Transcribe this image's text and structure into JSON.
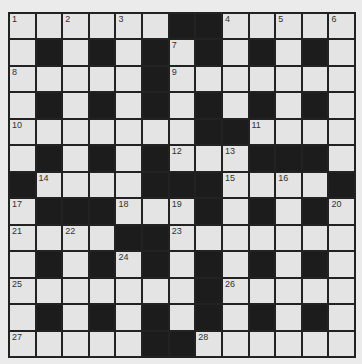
{
  "puzzle": {
    "rows": 13,
    "cols": 13,
    "colors": {
      "background": "#ebebeb",
      "cell": "#e4e4e4",
      "block": "#1c1c1c",
      "line": "#222222",
      "number": "#333333"
    },
    "layout": [
      "......##.....",
      ".#.#.#.#.#.#.",
      ".....#.......",
      ".#.#.#.#.#.#.",
      ".......##....",
      ".#.#.#...###.",
      "#....###....#",
      ".###...#.#.#.",
      "....##.......",
      ".#.#.#.#.#.#.",
      ".......#.....",
      ".#.#.#.#.#.#.",
      ".....##......"
    ],
    "numbers": [
      {
        "r": 0,
        "c": 0,
        "n": "1"
      },
      {
        "r": 0,
        "c": 2,
        "n": "2"
      },
      {
        "r": 0,
        "c": 4,
        "n": "3"
      },
      {
        "r": 0,
        "c": 8,
        "n": "4"
      },
      {
        "r": 0,
        "c": 10,
        "n": "5"
      },
      {
        "r": 0,
        "c": 12,
        "n": "6"
      },
      {
        "r": 1,
        "c": 6,
        "n": "7"
      },
      {
        "r": 2,
        "c": 0,
        "n": "8"
      },
      {
        "r": 2,
        "c": 6,
        "n": "9"
      },
      {
        "r": 4,
        "c": 0,
        "n": "10"
      },
      {
        "r": 4,
        "c": 9,
        "n": "11"
      },
      {
        "r": 5,
        "c": 6,
        "n": "12"
      },
      {
        "r": 5,
        "c": 8,
        "n": "13"
      },
      {
        "r": 6,
        "c": 1,
        "n": "14"
      },
      {
        "r": 6,
        "c": 8,
        "n": "15"
      },
      {
        "r": 6,
        "c": 10,
        "n": "16"
      },
      {
        "r": 7,
        "c": 0,
        "n": "17"
      },
      {
        "r": 7,
        "c": 4,
        "n": "18"
      },
      {
        "r": 7,
        "c": 6,
        "n": "19"
      },
      {
        "r": 7,
        "c": 12,
        "n": "20"
      },
      {
        "r": 8,
        "c": 0,
        "n": "21"
      },
      {
        "r": 8,
        "c": 2,
        "n": "22"
      },
      {
        "r": 8,
        "c": 6,
        "n": "23"
      },
      {
        "r": 9,
        "c": 4,
        "n": "24"
      },
      {
        "r": 10,
        "c": 0,
        "n": "25"
      },
      {
        "r": 10,
        "c": 8,
        "n": "26"
      },
      {
        "r": 12,
        "c": 0,
        "n": "27"
      },
      {
        "r": 12,
        "c": 7,
        "n": "28"
      }
    ]
  }
}
